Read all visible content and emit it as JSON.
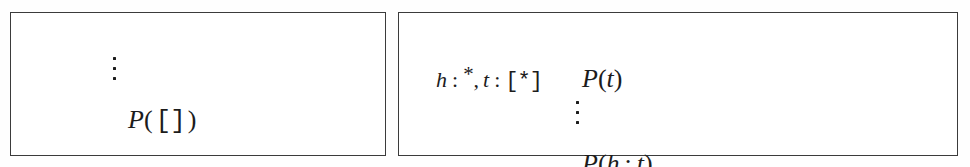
{
  "figure": {
    "background_color": "#fefefe",
    "ink_color": "#1c1c1c",
    "border_color": "#3b3b3b"
  },
  "boxes": [
    {
      "id": "base-case",
      "name": "base-case-derivation-box",
      "ellipsis": "⋮",
      "conclusion": {
        "predicate": "P",
        "open_paren": "(",
        "argument": "[]",
        "close_paren": ")",
        "full_text": "P([])"
      }
    },
    {
      "id": "inductive-case",
      "name": "inductive-case-derivation-box",
      "hypothesis": {
        "head_var": "h",
        "colon_1": ":",
        "head_type": "*",
        "comma": ",",
        "tail_var": "t",
        "colon_2": ":",
        "tail_type": "[*]",
        "full_text": "h : *, t : [*]"
      },
      "premise": {
        "predicate": "P",
        "open_paren": "(",
        "argument": "t",
        "close_paren": ")",
        "full_text": "P(t)"
      },
      "ellipsis": "⋮",
      "conclusion": {
        "predicate": "P",
        "open_paren": "(",
        "head_var": "h",
        "cons": ":",
        "tail_var": "t",
        "close_paren": ")",
        "full_text": "P(h : t)"
      }
    }
  ]
}
